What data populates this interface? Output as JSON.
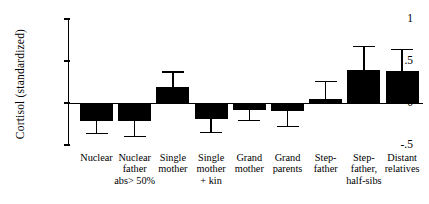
{
  "chart_data": {
    "type": "bar",
    "title": "",
    "subtitle": "",
    "xlabel": "",
    "ylabel": "Cortisol  (standardized)",
    "ylim": [
      -0.5,
      1.0
    ],
    "yticks": [
      1,
      0.5,
      0,
      -0.5
    ],
    "ytick_labels": [
      "1",
      ".5",
      "0",
      "-.5"
    ],
    "grid": false,
    "legend": "none",
    "error_bars": "one-sided (away from zero)",
    "bar_color": "#000000",
    "categories": [
      "Nuclear",
      "Nuclear father abs> 50%",
      "Single mother",
      "Single mother + kin",
      "Grand mother",
      "Grand parents",
      "Step-father",
      "Step-father, half-sibs",
      "Distant relatives"
    ],
    "category_lines": [
      [
        "Nuclear"
      ],
      [
        "Nuclear",
        "father",
        "abs> 50%"
      ],
      [
        "Single",
        "mother"
      ],
      [
        "Single",
        "mother",
        "+ kin"
      ],
      [
        "Grand",
        "mother"
      ],
      [
        "Grand",
        "parents"
      ],
      [
        "Step-",
        "father"
      ],
      [
        "Step-",
        "father,",
        "half-sibs"
      ],
      [
        "Distant",
        "relatives"
      ]
    ],
    "values": [
      -0.22,
      -0.21,
      0.19,
      -0.19,
      -0.08,
      -0.1,
      0.05,
      0.39,
      0.38
    ],
    "error_ends": [
      -0.36,
      -0.4,
      0.37,
      -0.35,
      -0.21,
      -0.28,
      0.26,
      0.67,
      0.64
    ],
    "errors": [
      0.14,
      0.19,
      0.18,
      0.16,
      0.13,
      0.18,
      0.21,
      0.28,
      0.26
    ]
  }
}
